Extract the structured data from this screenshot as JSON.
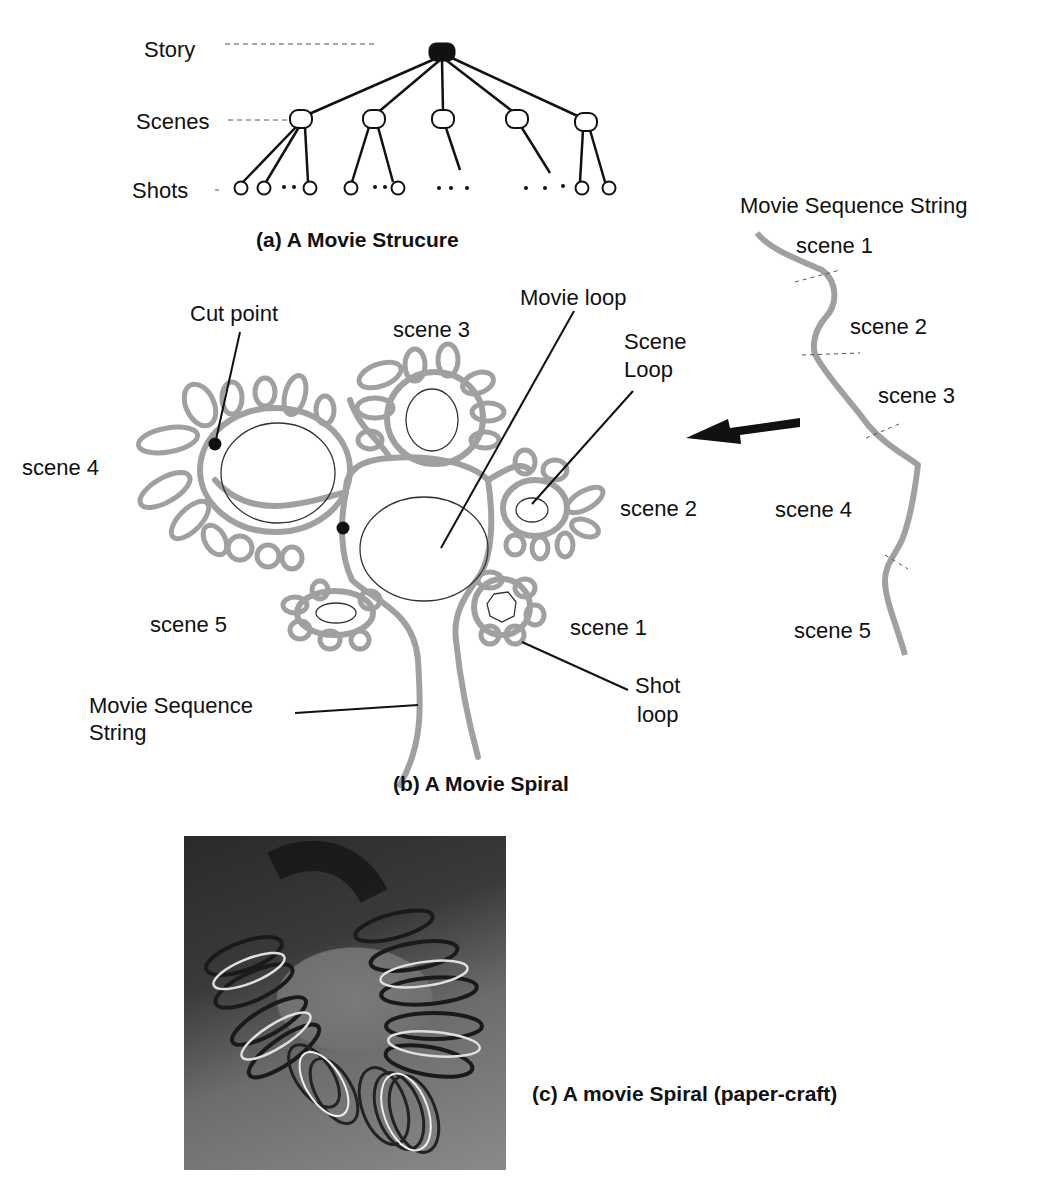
{
  "figure_a": {
    "caption": "(a)  A Movie Strucure",
    "levels": {
      "story": "Story",
      "scenes": "Scenes",
      "shots": "Shots"
    }
  },
  "figure_b": {
    "caption": "(b) A Movie Spiral",
    "labels": {
      "cut_point": "Cut point",
      "movie_loop": "Movie loop",
      "scene_loop_line1": "Scene",
      "scene_loop_line2": "Loop",
      "shot_loop_line1": "Shot",
      "shot_loop_line2": "loop",
      "seq_string_line1": "Movie Sequence",
      "seq_string_line2": "String"
    },
    "scenes": [
      "scene 1",
      "scene 2",
      "scene 3",
      "scene 4",
      "scene 5"
    ]
  },
  "sequence_string": {
    "title": "Movie Sequence String",
    "scenes": [
      "scene 1",
      "scene 2",
      "scene 3",
      "scene 4",
      "scene 5"
    ]
  },
  "figure_c": {
    "caption": "(c) A movie Spiral (paper-craft)"
  },
  "colors": {
    "spiral_gray": "#a0a0a0",
    "ink": "#111111"
  }
}
